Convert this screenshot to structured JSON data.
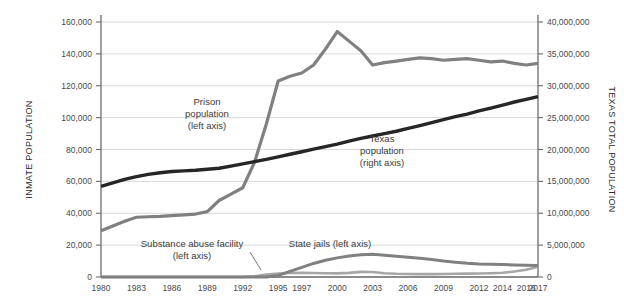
{
  "chart_data": {
    "type": "line",
    "title": "",
    "subtitle": "",
    "xlabel": "",
    "ylabel": "INMATE POPULATION",
    "y2label": "TEXAS TOTAL POPULATION",
    "grid": true,
    "legend_position": "inline-annotations",
    "x": [
      1980,
      1981,
      1982,
      1983,
      1984,
      1985,
      1986,
      1987,
      1988,
      1989,
      1990,
      1991,
      1992,
      1993,
      1994,
      1995,
      1996,
      1997,
      1998,
      1999,
      2000,
      2001,
      2002,
      2003,
      2004,
      2005,
      2006,
      2007,
      2008,
      2009,
      2010,
      2011,
      2012,
      2013,
      2014,
      2015,
      2016,
      2017
    ],
    "xtick_labels": [
      "1980",
      "1983",
      "1986",
      "1989",
      "1992",
      "1995",
      "1997",
      "2000",
      "2003",
      "2006",
      "2009",
      "2012",
      "2014",
      "2016",
      "2017"
    ],
    "xticks": [
      1980,
      1983,
      1986,
      1989,
      1992,
      1995,
      1997,
      2000,
      2003,
      2006,
      2009,
      2012,
      2014,
      2016,
      2017
    ],
    "ylim": [
      0,
      160000
    ],
    "yticks": [
      0,
      20000,
      40000,
      60000,
      80000,
      100000,
      120000,
      140000,
      160000
    ],
    "ytick_labels": [
      "0",
      "20,000",
      "40,000",
      "60,000",
      "80,000",
      "100,000",
      "120,000",
      "140,000",
      "160,000"
    ],
    "y2lim": [
      0,
      40000000
    ],
    "y2ticks": [
      0,
      5000000,
      10000000,
      15000000,
      20000000,
      25000000,
      30000000,
      35000000,
      40000000
    ],
    "y2tick_labels": [
      "0",
      "5,000,000",
      "10,000,000",
      "15,000,000",
      "20,000,000",
      "25,000,000",
      "30,000,000",
      "35,000,000",
      "40,000,000"
    ],
    "series": [
      {
        "name": "Prison population (left axis)",
        "axis": "left",
        "color": "#808080",
        "width": 3.2,
        "values": [
          29000,
          32000,
          35000,
          37500,
          37800,
          38000,
          38500,
          39000,
          39500,
          41000,
          48000,
          52000,
          56000,
          72000,
          96000,
          123000,
          126000,
          128000,
          133000,
          143000,
          154000,
          148000,
          142000,
          133000,
          134500,
          135500,
          136500,
          137500,
          137000,
          136000,
          136500,
          137000,
          136000,
          135000,
          135500,
          134000,
          133000,
          134000
        ]
      },
      {
        "name": "Texas population (right axis)",
        "axis": "right",
        "color": "#262626",
        "width": 3.4,
        "values": [
          14230000,
          14750000,
          15300000,
          15750000,
          16100000,
          16350000,
          16550000,
          16650000,
          16750000,
          16900000,
          17060000,
          17400000,
          17750000,
          18100000,
          18450000,
          18850000,
          19250000,
          19650000,
          20050000,
          20450000,
          20850000,
          21300000,
          21750000,
          22120000,
          22490000,
          22860000,
          23310000,
          23760000,
          24220000,
          24680000,
          25150000,
          25550000,
          26060000,
          26500000,
          26960000,
          27450000,
          27860000,
          28300000
        ]
      },
      {
        "name": "State jails (left axis)",
        "axis": "left",
        "color": "#808080",
        "width": 3.0,
        "values": [
          0,
          0,
          0,
          0,
          0,
          0,
          0,
          0,
          0,
          0,
          0,
          0,
          0,
          0,
          0,
          1000,
          3500,
          6000,
          8500,
          10500,
          12000,
          13200,
          14000,
          14200,
          13600,
          13000,
          12400,
          11800,
          11000,
          10000,
          9300,
          8600,
          8200,
          8000,
          7800,
          7600,
          7400,
          7200
        ]
      },
      {
        "name": "Substance abuse facility (left axis)",
        "axis": "left",
        "color": "#a6a6a6",
        "width": 2.6,
        "values": [
          0,
          0,
          0,
          0,
          0,
          0,
          0,
          0,
          0,
          0,
          0,
          0,
          0,
          500,
          1500,
          2200,
          2500,
          2600,
          2500,
          2400,
          2300,
          2600,
          3200,
          3100,
          2400,
          2000,
          1900,
          1800,
          1800,
          1900,
          2000,
          2100,
          2200,
          2400,
          2700,
          3400,
          4600,
          6500
        ]
      }
    ],
    "annotations": [
      {
        "name": "prison-population-annotation",
        "lines": [
          "Prison",
          "population",
          "(left axis)"
        ],
        "x_px": 207,
        "y_px": 105
      },
      {
        "name": "texas-population-annotation",
        "lines": [
          "Texas",
          "population",
          "(right axis)"
        ],
        "x_px": 382,
        "y_px": 142
      },
      {
        "name": "substance-abuse-facility-annotation",
        "lines": [
          "Substance abuse facility",
          "(left axis)"
        ],
        "x_px": 192,
        "y_px": 247
      },
      {
        "name": "state-jails-annotation",
        "lines": [
          "State jails (left axis)"
        ],
        "x_px": 330,
        "y_px": 247
      }
    ]
  }
}
